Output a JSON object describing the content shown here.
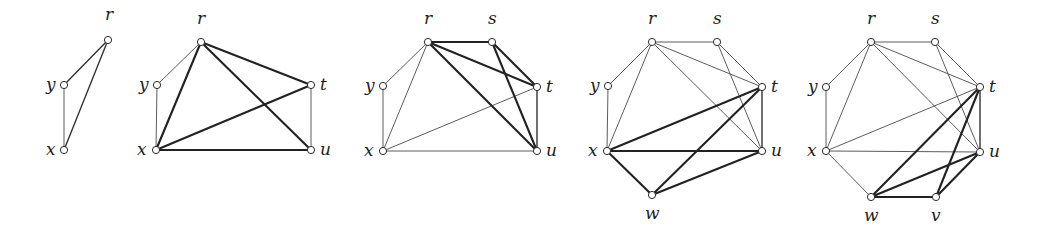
{
  "figure": {
    "panels": [
      {
        "id": "panel-1",
        "nodes": [
          {
            "id": "r",
            "label": "r",
            "x": 108,
            "y": 40,
            "lx": 105,
            "ly": 20
          },
          {
            "id": "y",
            "label": "y",
            "x": 64,
            "y": 85,
            "lx": 46,
            "ly": 90
          },
          {
            "id": "x",
            "label": "x",
            "x": 64,
            "y": 150,
            "lx": 46,
            "ly": 155
          }
        ],
        "edges": [
          {
            "from": "r",
            "to": "y",
            "weight": "medium"
          },
          {
            "from": "r",
            "to": "x",
            "weight": "medium"
          },
          {
            "from": "y",
            "to": "x",
            "weight": "thin"
          }
        ]
      },
      {
        "id": "panel-2",
        "nodes": [
          {
            "id": "r",
            "label": "r",
            "x": 201,
            "y": 42,
            "lx": 197,
            "ly": 24
          },
          {
            "id": "y",
            "label": "y",
            "x": 157,
            "y": 85,
            "lx": 139,
            "ly": 90
          },
          {
            "id": "x",
            "label": "x",
            "x": 156,
            "y": 150,
            "lx": 137,
            "ly": 155
          },
          {
            "id": "t",
            "label": "t",
            "x": 311,
            "y": 85,
            "lx": 320,
            "ly": 90
          },
          {
            "id": "u",
            "label": "u",
            "x": 311,
            "y": 150,
            "lx": 320,
            "ly": 155
          }
        ],
        "edges": [
          {
            "from": "y",
            "to": "r",
            "weight": "thin"
          },
          {
            "from": "y",
            "to": "x",
            "weight": "thin"
          },
          {
            "from": "t",
            "to": "u",
            "weight": "thin"
          },
          {
            "from": "r",
            "to": "x",
            "weight": "bold"
          },
          {
            "from": "r",
            "to": "t",
            "weight": "bold"
          },
          {
            "from": "r",
            "to": "u",
            "weight": "bold"
          },
          {
            "from": "x",
            "to": "t",
            "weight": "bold"
          },
          {
            "from": "x",
            "to": "u",
            "weight": "bold"
          }
        ]
      },
      {
        "id": "panel-3",
        "nodes": [
          {
            "id": "r",
            "label": "r",
            "x": 428,
            "y": 42,
            "lx": 424,
            "ly": 24
          },
          {
            "id": "s",
            "label": "s",
            "x": 492,
            "y": 42,
            "lx": 488,
            "ly": 24
          },
          {
            "id": "y",
            "label": "y",
            "x": 383,
            "y": 86,
            "lx": 365,
            "ly": 91
          },
          {
            "id": "x",
            "label": "x",
            "x": 383,
            "y": 151,
            "lx": 364,
            "ly": 156
          },
          {
            "id": "t",
            "label": "t",
            "x": 537,
            "y": 87,
            "lx": 546,
            "ly": 92
          },
          {
            "id": "u",
            "label": "u",
            "x": 537,
            "y": 151,
            "lx": 546,
            "ly": 156
          }
        ],
        "edges": [
          {
            "from": "y",
            "to": "r",
            "weight": "thin"
          },
          {
            "from": "y",
            "to": "x",
            "weight": "thin"
          },
          {
            "from": "r",
            "to": "x",
            "weight": "thin"
          },
          {
            "from": "x",
            "to": "t",
            "weight": "thin"
          },
          {
            "from": "x",
            "to": "u",
            "weight": "thin"
          },
          {
            "from": "t",
            "to": "u",
            "weight": "medium"
          },
          {
            "from": "r",
            "to": "s",
            "weight": "bold"
          },
          {
            "from": "r",
            "to": "t",
            "weight": "bold"
          },
          {
            "from": "r",
            "to": "u",
            "weight": "bold"
          },
          {
            "from": "s",
            "to": "t",
            "weight": "bold"
          },
          {
            "from": "s",
            "to": "u",
            "weight": "bold"
          }
        ]
      },
      {
        "id": "panel-4",
        "nodes": [
          {
            "id": "r",
            "label": "r",
            "x": 652,
            "y": 42,
            "lx": 648,
            "ly": 24
          },
          {
            "id": "s",
            "label": "s",
            "x": 717,
            "y": 42,
            "lx": 713,
            "ly": 24
          },
          {
            "id": "y",
            "label": "y",
            "x": 608,
            "y": 86,
            "lx": 590,
            "ly": 91
          },
          {
            "id": "x",
            "label": "x",
            "x": 607,
            "y": 151,
            "lx": 588,
            "ly": 156
          },
          {
            "id": "t",
            "label": "t",
            "x": 762,
            "y": 87,
            "lx": 771,
            "ly": 92
          },
          {
            "id": "u",
            "label": "u",
            "x": 762,
            "y": 151,
            "lx": 771,
            "ly": 156
          },
          {
            "id": "w",
            "label": "w",
            "x": 652,
            "y": 195,
            "lx": 645,
            "ly": 219
          }
        ],
        "edges": [
          {
            "from": "y",
            "to": "r",
            "weight": "thin"
          },
          {
            "from": "y",
            "to": "x",
            "weight": "thin"
          },
          {
            "from": "r",
            "to": "x",
            "weight": "thin"
          },
          {
            "from": "r",
            "to": "s",
            "weight": "thin"
          },
          {
            "from": "r",
            "to": "t",
            "weight": "thin"
          },
          {
            "from": "r",
            "to": "u",
            "weight": "thin"
          },
          {
            "from": "s",
            "to": "t",
            "weight": "thin"
          },
          {
            "from": "s",
            "to": "u",
            "weight": "thin"
          },
          {
            "from": "t",
            "to": "u",
            "weight": "medium"
          },
          {
            "from": "x",
            "to": "t",
            "weight": "bold"
          },
          {
            "from": "x",
            "to": "u",
            "weight": "bold"
          },
          {
            "from": "x",
            "to": "w",
            "weight": "bold"
          },
          {
            "from": "w",
            "to": "t",
            "weight": "bold"
          },
          {
            "from": "w",
            "to": "u",
            "weight": "bold"
          }
        ]
      },
      {
        "id": "panel-5",
        "nodes": [
          {
            "id": "r",
            "label": "r",
            "x": 871,
            "y": 42,
            "lx": 867,
            "ly": 24
          },
          {
            "id": "s",
            "label": "s",
            "x": 935,
            "y": 42,
            "lx": 931,
            "ly": 24
          },
          {
            "id": "y",
            "label": "y",
            "x": 826,
            "y": 87,
            "lx": 808,
            "ly": 92
          },
          {
            "id": "x",
            "label": "x",
            "x": 826,
            "y": 151,
            "lx": 807,
            "ly": 156
          },
          {
            "id": "t",
            "label": "t",
            "x": 980,
            "y": 87,
            "lx": 989,
            "ly": 92
          },
          {
            "id": "u",
            "label": "u",
            "x": 980,
            "y": 152,
            "lx": 989,
            "ly": 157
          },
          {
            "id": "w",
            "label": "w",
            "x": 871,
            "y": 197,
            "lx": 864,
            "ly": 221
          },
          {
            "id": "v",
            "label": "v",
            "x": 936,
            "y": 197,
            "lx": 931,
            "ly": 221
          }
        ],
        "edges": [
          {
            "from": "y",
            "to": "r",
            "weight": "thin"
          },
          {
            "from": "y",
            "to": "x",
            "weight": "thin"
          },
          {
            "from": "r",
            "to": "x",
            "weight": "thin"
          },
          {
            "from": "r",
            "to": "s",
            "weight": "thin"
          },
          {
            "from": "r",
            "to": "t",
            "weight": "thin"
          },
          {
            "from": "r",
            "to": "u",
            "weight": "thin"
          },
          {
            "from": "s",
            "to": "t",
            "weight": "thin"
          },
          {
            "from": "s",
            "to": "u",
            "weight": "thin"
          },
          {
            "from": "x",
            "to": "t",
            "weight": "thin"
          },
          {
            "from": "x",
            "to": "u",
            "weight": "thin"
          },
          {
            "from": "x",
            "to": "w",
            "weight": "thin"
          },
          {
            "from": "t",
            "to": "u",
            "weight": "medium"
          },
          {
            "from": "w",
            "to": "t",
            "weight": "bold"
          },
          {
            "from": "w",
            "to": "u",
            "weight": "bold"
          },
          {
            "from": "w",
            "to": "v",
            "weight": "bold"
          },
          {
            "from": "v",
            "to": "t",
            "weight": "bold"
          },
          {
            "from": "v",
            "to": "u",
            "weight": "bold"
          }
        ]
      }
    ]
  }
}
